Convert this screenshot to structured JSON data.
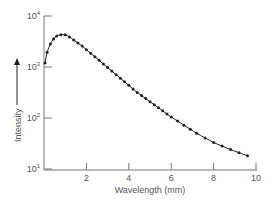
{
  "chart_data": {
    "type": "line",
    "title": "",
    "xlabel": "Wavelength (mm)",
    "ylabel": "Intensity",
    "xlim": [
      0,
      10
    ],
    "ylim_log10": [
      1,
      4
    ],
    "yscale": "log",
    "grid": false,
    "legend": null,
    "x_ticks": [
      2,
      4,
      6,
      8,
      10
    ],
    "y_ticks": [
      {
        "base": "10",
        "exp": "4",
        "log": 4
      },
      {
        "base": "10",
        "exp": "3",
        "log": 3
      },
      {
        "base": "10",
        "exp": "2",
        "log": 2
      },
      {
        "base": "10",
        "exp": "1",
        "log": 1
      }
    ],
    "series": [
      {
        "name": "measured",
        "marker": "dot",
        "line": "smooth",
        "color": "#222222",
        "x": [
          0.05,
          0.15,
          0.3,
          0.45,
          0.6,
          0.8,
          1.0,
          1.2,
          1.4,
          1.6,
          1.8,
          2.0,
          2.2,
          2.4,
          2.6,
          2.8,
          3.0,
          3.2,
          3.4,
          3.6,
          3.8,
          4.0,
          4.2,
          4.4,
          4.6,
          4.8,
          5.0,
          5.2,
          5.4,
          5.6,
          5.8,
          6.0,
          6.3,
          6.6,
          6.9,
          7.2,
          7.6,
          8.0,
          8.4,
          8.8,
          9.2,
          9.6
        ],
        "log10_y": [
          3.08,
          3.29,
          3.45,
          3.55,
          3.61,
          3.63,
          3.63,
          3.59,
          3.53,
          3.47,
          3.41,
          3.34,
          3.27,
          3.2,
          3.13,
          3.06,
          2.99,
          2.92,
          2.85,
          2.78,
          2.71,
          2.64,
          2.57,
          2.5,
          2.44,
          2.38,
          2.32,
          2.26,
          2.2,
          2.14,
          2.08,
          2.02,
          1.94,
          1.86,
          1.78,
          1.7,
          1.61,
          1.52,
          1.45,
          1.38,
          1.32,
          1.26
        ]
      }
    ]
  },
  "axes": {
    "y_arrow": "up-arrow"
  }
}
